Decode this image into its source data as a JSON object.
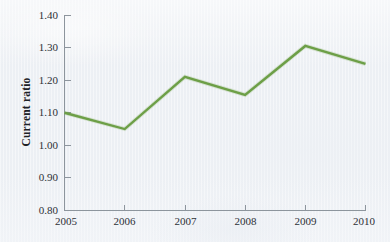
{
  "chart_data": {
    "type": "line",
    "title": "",
    "subtitle": "",
    "xlabel": "",
    "ylabel": "Current ratio",
    "categories": [
      "2005",
      "2006",
      "2007",
      "2008",
      "2009",
      "2010"
    ],
    "x": [
      2005,
      2006,
      2007,
      2008,
      2009,
      2010
    ],
    "values": [
      1.1,
      1.05,
      1.21,
      1.155,
      1.305,
      1.25
    ],
    "series": [
      {
        "name": "Current ratio",
        "values": [
          1.1,
          1.05,
          1.21,
          1.155,
          1.305,
          1.25
        ],
        "color": "#6d9f47"
      }
    ],
    "ylim": [
      0.8,
      1.4
    ],
    "ytick_step": 0.1,
    "ytick_labels": [
      "1.40",
      "1.30",
      "1.20",
      "1.10",
      "1.00",
      "0.90",
      "0.80"
    ],
    "ytick_values": [
      1.4,
      1.3,
      1.2,
      1.1,
      1.0,
      0.9,
      0.8
    ],
    "xtick_labels": [
      "2005",
      "2006",
      "2007",
      "2008",
      "2009",
      "2010"
    ],
    "grid": false,
    "legend": false,
    "legend_position": "none",
    "annotations": []
  },
  "axes": {
    "y_title": "Current ratio",
    "y_ticks": [
      {
        "label": "1.40",
        "value": 1.4
      },
      {
        "label": "1.30",
        "value": 1.3
      },
      {
        "label": "1.20",
        "value": 1.2
      },
      {
        "label": "1.10",
        "value": 1.1
      },
      {
        "label": "1.00",
        "value": 1.0
      },
      {
        "label": "0.90",
        "value": 0.9
      },
      {
        "label": "0.80",
        "value": 0.8
      }
    ],
    "x_ticks": [
      {
        "label": "2005",
        "value": 2005
      },
      {
        "label": "2006",
        "value": 2006
      },
      {
        "label": "2007",
        "value": 2007
      },
      {
        "label": "2008",
        "value": 2008
      },
      {
        "label": "2009",
        "value": 2009
      },
      {
        "label": "2010",
        "value": 2010
      }
    ]
  },
  "style": {
    "background_color": "#eef1f5",
    "line_color": "#6d9f47",
    "axis_color": "#8d959d",
    "text_color": "#2c3036"
  }
}
